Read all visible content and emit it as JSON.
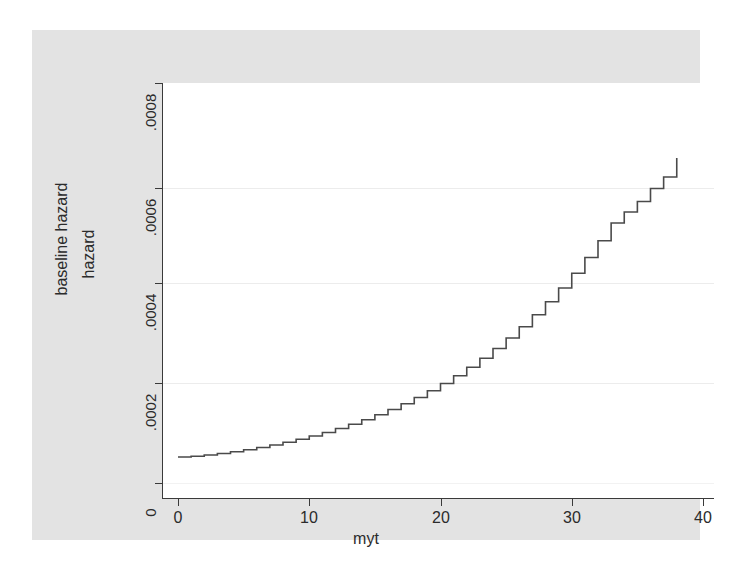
{
  "chart_data": {
    "type": "line",
    "subtype": "step",
    "title": "",
    "xlabel": "myt",
    "ylabel": "hazard",
    "ylabel_outer": "baseline hazard",
    "xlim": [
      -1.2,
      41.5
    ],
    "ylim": [
      -3e-05,
      0.000832
    ],
    "xticks": [
      0,
      10,
      20,
      30,
      40
    ],
    "xticklabels": [
      "0",
      "10",
      "20",
      "30",
      "40"
    ],
    "yticks": [
      0,
      0.0002,
      0.0004,
      0.0006,
      0.0008
    ],
    "yticklabels": [
      "0",
      ".0002",
      ".0004",
      ".0006",
      ".0008"
    ],
    "grid": "horizontal-dotted",
    "legend": "none",
    "series": [
      {
        "name": "baseline hazard",
        "color": "#4a4a4a",
        "step": "post",
        "x": [
          0,
          1,
          2,
          3,
          4,
          5,
          6,
          7,
          8,
          9,
          10,
          11,
          12,
          13,
          14,
          15,
          16,
          17,
          18,
          19,
          20,
          21,
          22,
          23,
          24,
          25,
          26,
          27,
          28,
          29,
          30,
          31,
          32,
          33,
          34,
          35,
          36,
          37,
          38,
          38
        ],
        "y": [
          5.2e-05,
          5.35e-05,
          5.6e-05,
          5.9e-05,
          6.25e-05,
          6.65e-05,
          7.1e-05,
          7.6e-05,
          8.15e-05,
          8.75e-05,
          9.4e-05,
          0.000101,
          0.000109,
          0.0001175,
          0.0001265,
          0.0001365,
          0.000147,
          0.0001585,
          0.000171,
          0.0001845,
          0.000199,
          0.0002145,
          0.0002315,
          0.0002495,
          0.000269,
          0.00029,
          0.0003125,
          0.0003365,
          0.0003625,
          0.00039,
          0.0004195,
          0.000451,
          0.0004845,
          0.00052,
          0.000542,
          0.000563,
          0.000589,
          0.000612,
          0.000616,
          0.00065
        ]
      }
    ]
  },
  "axes": {
    "x_title": "myt",
    "y_title_inner": "hazard",
    "y_title_outer": "baseline hazard"
  },
  "colors": {
    "figure_background": "#e3e3e3",
    "plot_background": "#ffffff",
    "axis": "#3a3a3a",
    "gridline": "#ececec",
    "curve": "#4a4a4a",
    "text": "#2b2b2b"
  }
}
